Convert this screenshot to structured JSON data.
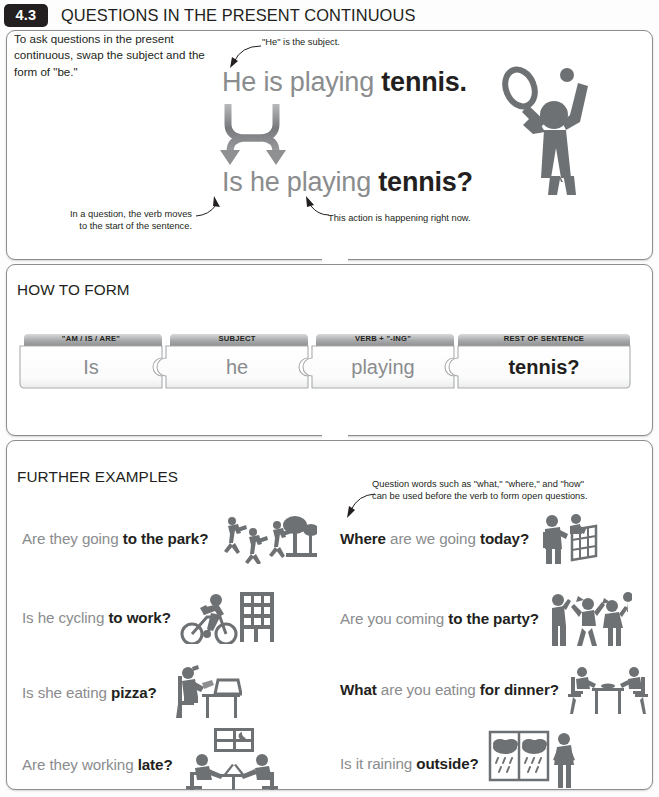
{
  "header": {
    "number": "4.3",
    "title": "QUESTIONS IN THE PRESENT CONTINUOUS"
  },
  "intro": "To ask questions in the present continuous, swap the subject and the form of \"be.\"",
  "example": {
    "statement": {
      "gray": "He is playing ",
      "bold": "tennis."
    },
    "question": {
      "gray": "Is he playing ",
      "bold": "tennis?"
    },
    "callout_subject": "\"He\" is the subject.",
    "callout_verb_line1": "In a question, the verb moves",
    "callout_verb_line2": "to the start of the sentence.",
    "callout_now": "This action is happening right now."
  },
  "how_to_form": {
    "title": "HOW TO FORM",
    "pieces": [
      {
        "label": "\"AM / IS / ARE\"",
        "word": "Is",
        "emphasis": false
      },
      {
        "label": "SUBJECT",
        "word": "he",
        "emphasis": false
      },
      {
        "label": "VERB + \"-ING\"",
        "word": "playing",
        "emphasis": false
      },
      {
        "label": "REST OF SENTENCE",
        "word": "tennis?",
        "emphasis": true
      }
    ]
  },
  "further_examples": {
    "title": "FURTHER EXAMPLES",
    "callout_line1": "Question words such as \"what,\" \"where,\" and \"how\"",
    "callout_line2": "can be used before the verb to form open questions.",
    "left": [
      {
        "gray_lead": "",
        "gray": "Are they going ",
        "bold": "to the park?",
        "icon": "people-running-park-icon"
      },
      {
        "gray_lead": "",
        "gray": "Is he cycling ",
        "bold": "to work?",
        "icon": "cyclist-office-icon"
      },
      {
        "gray_lead": "",
        "gray": "Is she eating ",
        "bold": "pizza?",
        "icon": "person-eating-desk-icon"
      },
      {
        "gray_lead": "",
        "gray": "Are they working ",
        "bold": "late?",
        "icon": "office-night-meeting-icon"
      }
    ],
    "right": [
      {
        "gray_lead": "Where",
        "gray": " are we going ",
        "bold": "today?",
        "icon": "tourist-map-icon"
      },
      {
        "gray_lead": "",
        "gray": "Are you coming ",
        "bold": "to the party?",
        "icon": "party-people-icon"
      },
      {
        "gray_lead": "What",
        "gray": " are you eating ",
        "bold": "for dinner?",
        "icon": "dinner-table-icon"
      },
      {
        "gray_lead": "",
        "gray": "Is it raining ",
        "bold": "outside?",
        "icon": "rain-window-icon"
      }
    ]
  },
  "colors": {
    "ink": "#231f20",
    "gray_text": "#8a8c8e",
    "panel_border": "#8b8d8f",
    "icon_gray": "#6e7173"
  }
}
